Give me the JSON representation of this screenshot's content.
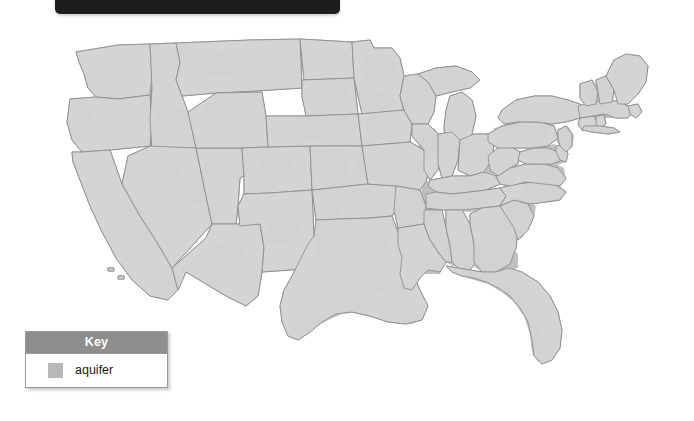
{
  "window": {
    "titlebar_text": "",
    "background_color": "#ffffff"
  },
  "map": {
    "title": "",
    "region": "Contiguous United States",
    "projection": "albers-usa",
    "base_fill": "#d4d4d4",
    "aquifer_fill": "#bdbdbd",
    "border_color": "#8f8f8f",
    "water_color": "#ffffff"
  },
  "legend": {
    "header": "Key",
    "items": [
      {
        "label": "aquifer",
        "color": "#b8b8b8"
      }
    ]
  }
}
